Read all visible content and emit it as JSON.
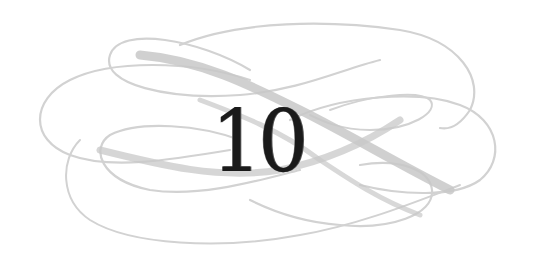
{
  "ornament": {
    "chapter_number": "10",
    "flourish_icon": "calligraphic-flourish-icon",
    "colors": {
      "background": "#ffffff",
      "flourish": "#cfcfcf",
      "flourish_thick": "#c4c4c4",
      "numeral": "#1a1a1a"
    }
  }
}
